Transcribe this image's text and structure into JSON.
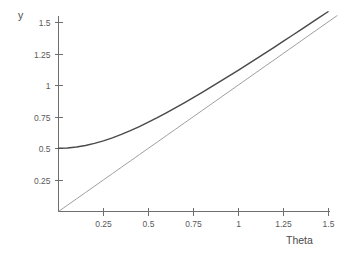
{
  "chart_data": {
    "type": "line",
    "title": "",
    "xlabel": "Theta",
    "ylabel": "y",
    "xlim": [
      0,
      1.5
    ],
    "ylim": [
      0,
      1.62
    ],
    "grid": false,
    "legend": "none",
    "xticks": [
      "0.25",
      "0.5",
      "0.75",
      "1",
      "1.25",
      "1.5"
    ],
    "xtick_values": [
      0.25,
      0.5,
      0.75,
      1,
      1.25,
      1.5
    ],
    "yticks": [
      "0.25",
      "0.5",
      "0.75",
      "1",
      "1.25",
      "1.5"
    ],
    "ytick_values": [
      0.25,
      0.5,
      0.75,
      1,
      1.25,
      1.5
    ],
    "x": [
      0,
      0.05,
      0.1,
      0.15,
      0.2,
      0.25,
      0.3,
      0.35,
      0.4,
      0.45,
      0.5,
      0.55,
      0.6,
      0.65,
      0.7,
      0.75,
      0.8,
      0.85,
      0.9,
      0.95,
      1,
      1.05,
      1.1,
      1.15,
      1.2,
      1.25,
      1.3,
      1.35,
      1.4,
      1.45,
      1.5,
      1.55
    ],
    "series": [
      {
        "name": "sqrt(theta^2 + 0.25)",
        "style": "thick",
        "values": [
          0.5,
          0.502,
          0.51,
          0.522,
          0.539,
          0.559,
          0.583,
          0.61,
          0.64,
          0.672,
          0.707,
          0.743,
          0.781,
          0.82,
          0.86,
          0.901,
          0.943,
          0.986,
          1.03,
          1.074,
          1.118,
          1.163,
          1.208,
          1.254,
          1.3,
          1.346,
          1.393,
          1.44,
          1.487,
          1.534,
          1.581,
          1.629
        ]
      },
      {
        "name": "theta",
        "style": "thin",
        "values": [
          0,
          0.05,
          0.1,
          0.15,
          0.2,
          0.25,
          0.3,
          0.35,
          0.4,
          0.45,
          0.5,
          0.55,
          0.6,
          0.65,
          0.7,
          0.75,
          0.8,
          0.85,
          0.9,
          0.95,
          1,
          1.05,
          1.1,
          1.15,
          1.2,
          1.25,
          1.3,
          1.35,
          1.4,
          1.45,
          1.5,
          1.55
        ]
      }
    ],
    "annotations": []
  },
  "colors": {
    "background": "#ffffff",
    "axis": "#6e6e6e",
    "thick_series": "#4a4a4a",
    "thin_series": "#8c8c8c",
    "text": "#5a5a5a"
  }
}
